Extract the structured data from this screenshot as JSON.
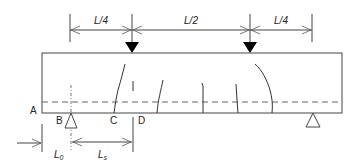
{
  "diagram": {
    "type": "four-point bending beam test schematic",
    "span_labels": [
      "L/4",
      "L/2",
      "L/4"
    ],
    "point_labels": {
      "A": "A",
      "B": "B",
      "C": "C",
      "D": "D"
    },
    "lower_dimensions": {
      "l0": {
        "main": "L",
        "sub": "0"
      },
      "ls": {
        "main": "L",
        "sub": "s"
      }
    },
    "loads": [
      {
        "name": "load-point-left",
        "position_fraction_of_span": 0.25
      },
      {
        "name": "load-point-right",
        "position_fraction_of_span": 0.75
      }
    ],
    "supports": [
      "support-left",
      "support-right"
    ],
    "cracks_count": 6,
    "colors": {
      "line": "#444444",
      "dashed": "#666666",
      "load_fill": "#000000",
      "background": "#ffffff"
    }
  }
}
